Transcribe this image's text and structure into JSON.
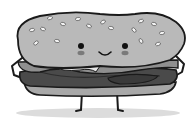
{
  "illustration": {
    "subject": "Cartoon smiling burger character",
    "style": "grayscale",
    "colors": {
      "background": "#ffffff",
      "outline": "#1a1a1a",
      "bun": "#b9b9b9",
      "bun_bottom": "#a8a8a8",
      "patty": "#4a4a4a",
      "patty_dark": "#3a3a3a",
      "lettuce": "#8f8f8f",
      "cheese": "#e6e6e6",
      "sesame": "#f2f2f2",
      "cheeks": "#7a7a7a",
      "shadow": "#dcdcdc"
    }
  }
}
